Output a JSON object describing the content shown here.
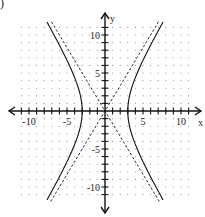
{
  "problem_marker": ")",
  "chart_data": {
    "type": "line",
    "title": "",
    "xlabel": "x",
    "ylabel": "y",
    "xlim": [
      -12.5,
      12.5
    ],
    "ylim": [
      -13,
      13
    ],
    "grid": "dots",
    "grid_range": {
      "x": [
        -11,
        11
      ],
      "y": [
        -11,
        11
      ]
    },
    "x_tick_labels": [
      {
        "value": -10,
        "label": "-10"
      },
      {
        "value": -5,
        "label": "-5"
      },
      {
        "value": 5,
        "label": "5"
      },
      {
        "value": 10,
        "label": "10"
      }
    ],
    "y_tick_labels": [
      {
        "value": 10,
        "label": "10"
      },
      {
        "value": 5,
        "label": "5"
      },
      {
        "value": -5,
        "label": "-5"
      },
      {
        "value": -10,
        "label": "-10"
      }
    ],
    "series": [
      {
        "name": "hyperbola",
        "style": "solid",
        "equation": "x^2/9 - y^2/25 = 1",
        "a": 3,
        "b": 5,
        "orientation": "horizontal",
        "vertices": [
          [
            -3,
            0
          ],
          [
            3,
            0
          ]
        ],
        "y_extent": 11.7
      },
      {
        "name": "asymptote-positive",
        "style": "dashed",
        "equation": "y = (5/3)x",
        "slope": 1.6667
      },
      {
        "name": "asymptote-negative",
        "style": "dashed",
        "equation": "y = -(5/3)x",
        "slope": -1.6667
      }
    ]
  },
  "layout": {
    "origin_px": [
      105,
      111
    ],
    "unit_px": 7.6,
    "x_axis_px": [
      9,
      201
    ],
    "y_axis_px": [
      13,
      213
    ],
    "colors": {
      "curve": "#111111",
      "axis": "#111111",
      "grid_dot": "#8a8a8a",
      "text": "#222222"
    }
  }
}
